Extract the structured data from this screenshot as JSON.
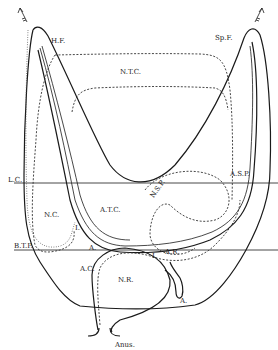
{
  "diagram": {
    "type": "anatomical line drawing",
    "labels": {
      "hf": "H.F.",
      "spf": "Sp.F.",
      "ntc": "N.T.C.",
      "lc": "L.C.",
      "nc": "N.C.",
      "atc": "A.T.C.",
      "nsp": "N.S.P.",
      "asp": "A.S.P.",
      "btp": "B.T.P.",
      "a_left": "A.",
      "ac": "A.C.",
      "i_left": "I.",
      "i_mid": "I.",
      "ar": "A.R.",
      "nr": "N.R.",
      "a_right": "A.",
      "anus": "Anus."
    },
    "icons": {
      "arrow_left": "feathered-arrow-up-left",
      "arrow_right": "feathered-arrow-up-right"
    },
    "colors": {
      "line": "#1a1a1a",
      "background": "#ffffff"
    }
  }
}
